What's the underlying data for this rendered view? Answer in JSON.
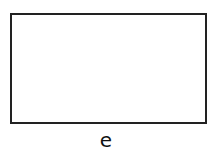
{
  "diagram": {
    "shape": "rectangle",
    "label": "e",
    "colors": {
      "stroke": "#222222",
      "fill": "#ffffff",
      "text": "#111111"
    }
  }
}
